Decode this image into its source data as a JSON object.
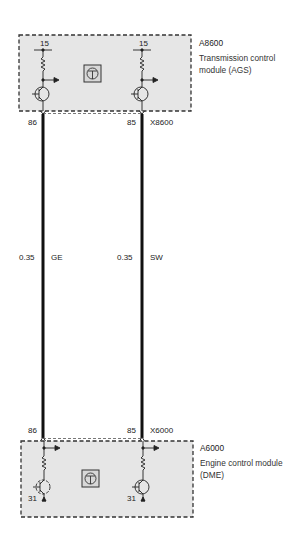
{
  "modules": {
    "top": {
      "id": "A8600",
      "name": "Transmission control module (AGS)",
      "connector": "X8600",
      "supply_left": "15",
      "supply_right": "15"
    },
    "bottom": {
      "id": "A6000",
      "name": "Engine control module (DME)",
      "connector": "X6000",
      "ground_left": "31",
      "ground_right": "31"
    }
  },
  "wires": [
    {
      "pin_top": "86",
      "pin_bottom": "86",
      "gauge": "0.35",
      "color_code": "GE"
    },
    {
      "pin_top": "85",
      "pin_bottom": "85",
      "gauge": "0.35",
      "color_code": "SW"
    }
  ],
  "style": {
    "module_fill": "#e6e6e6",
    "line_color": "#222222",
    "dash_color": "#333333"
  },
  "icons": {
    "top_module_icon": "control-unit-icon",
    "bottom_module_icon": "control-unit-icon"
  }
}
